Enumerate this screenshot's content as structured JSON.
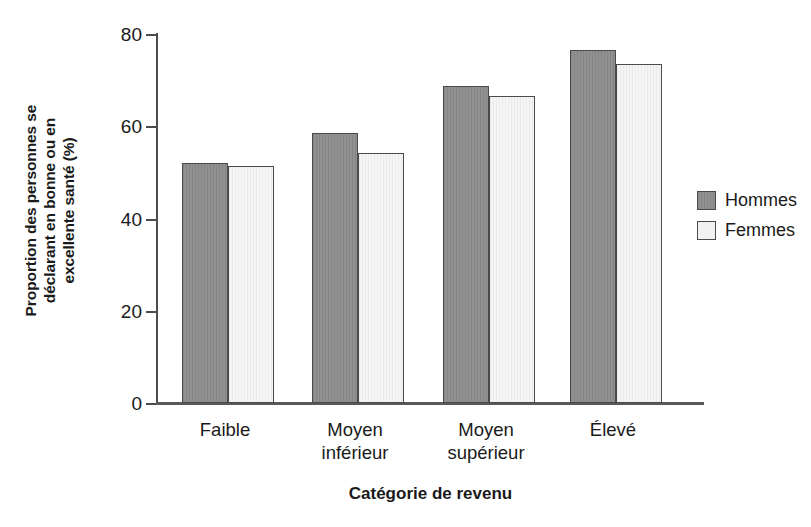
{
  "chart_data": {
    "type": "bar",
    "title": "",
    "xlabel": "Catégorie de revenu",
    "ylabel": "Proportion des personnes se déclarant en bonne ou en excellente santé (%)",
    "ylabel_lines": [
      "Proportion des personnes se",
      "déclarant en bonne ou en",
      "excellente santé (%)"
    ],
    "categories": [
      "Faible",
      "Moyen inférieur",
      "Moyen supérieur",
      "Élevé"
    ],
    "category_lines": [
      {
        "line1": "Faible",
        "line2": ""
      },
      {
        "line1": "Moyen",
        "line2": "inférieur"
      },
      {
        "line1": "Moyen",
        "line2": "supérieur"
      },
      {
        "line1": "Élevé",
        "line2": ""
      }
    ],
    "series": [
      {
        "name": "Hommes",
        "color": "#8b8b8b",
        "values": [
          52.0,
          58.5,
          68.7,
          76.5
        ]
      },
      {
        "name": "Femmes",
        "color": "#efefef",
        "values": [
          51.3,
          54.2,
          66.6,
          73.5
        ]
      }
    ],
    "ylim": [
      0,
      80
    ],
    "yticks": [
      0,
      20,
      40,
      60,
      80
    ],
    "ytick_labels": [
      "0",
      "20",
      "40",
      "60",
      "80"
    ],
    "grid": false,
    "legend_position": "right",
    "legend": [
      "Hommes",
      "Femmes"
    ]
  },
  "axis": {
    "y_tick_0": "0",
    "y_tick_20": "20",
    "y_tick_40": "40",
    "y_tick_60": "60",
    "y_tick_80": "80"
  },
  "legend": {
    "items": [
      {
        "label": "Hommes",
        "swatch": "dark-gray-swatch"
      },
      {
        "label": "Femmes",
        "swatch": "light-gray-swatch"
      }
    ]
  },
  "colors": {
    "men_bar": "#8b8b8b",
    "women_bar": "#efefef",
    "bar_outline": "#4a4a4a",
    "axis": "#4d4d4d",
    "text": "#1a1a1a",
    "background": "#ffffff"
  }
}
